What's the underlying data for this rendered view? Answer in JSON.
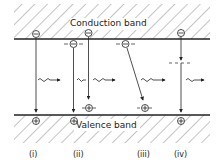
{
  "diagram": {
    "bands": {
      "conduction": "Conduction band",
      "valence": "Valence band"
    },
    "cases": [
      {
        "id": "i",
        "label": "(i)",
        "description": "Direct band-to-band recombination with photon emission"
      },
      {
        "id": "ii",
        "label": "(ii)",
        "description": "Recombination via donor/acceptor levels"
      },
      {
        "id": "iii",
        "label": "(iii)",
        "description": "Donor-acceptor pair recombination"
      },
      {
        "id": "iv",
        "label": "(iv)",
        "description": "Recombination via deep level"
      }
    ],
    "symbols": {
      "electron": "−",
      "hole": "+"
    },
    "colors": {
      "line": "#222222",
      "background": "#ffffff"
    }
  }
}
